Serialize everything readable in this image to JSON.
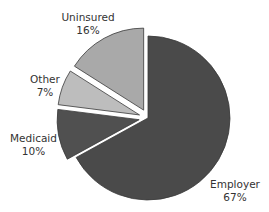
{
  "chart_data": {
    "type": "pie",
    "title": "",
    "exploded": true,
    "start_angle_deg": 0,
    "direction": "clockwise",
    "slices": [
      {
        "label": "Employer",
        "value": 67,
        "pct_label": "67%",
        "color": "#4a4a4a",
        "explode": 0
      },
      {
        "label": "Medicaid",
        "value": 10,
        "pct_label": "10%",
        "color": "#505050",
        "explode": 9
      },
      {
        "label": "Other",
        "value": 7,
        "pct_label": "7%",
        "color": "#bdbdbd",
        "explode": 9
      },
      {
        "label": "Uninsured",
        "value": 16,
        "pct_label": "16%",
        "color": "#a9a9a9",
        "explode": 9
      }
    ],
    "legend": "none (direct labels)"
  },
  "labels": {
    "employer": {
      "name": "Employer",
      "pct": "67%"
    },
    "medicaid": {
      "name": "Medicaid",
      "pct": "10%"
    },
    "other": {
      "name": "Other",
      "pct": "7%"
    },
    "uninsured": {
      "name": "Uninsured",
      "pct": "16%"
    }
  }
}
